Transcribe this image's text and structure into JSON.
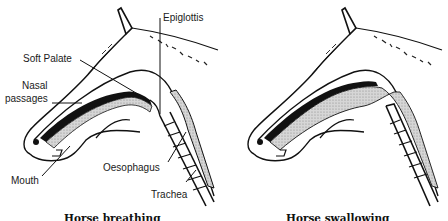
{
  "figure": {
    "panels": [
      {
        "id": "breathing",
        "caption": "Horse breathing",
        "labels": {
          "epiglottis": "Epiglottis",
          "soft_palate": "Soft Palate",
          "nasal_line1": "Nasal",
          "nasal_line2": "passages",
          "mouth": "Mouth",
          "oesophagus": "Oesophagus",
          "trachea": "Trachea"
        }
      },
      {
        "id": "swallowing",
        "caption": "Horse swallowing",
        "labels": {}
      }
    ],
    "colors": {
      "line": "#111111",
      "stipple": "#bdbdbd",
      "background": "#ffffff"
    }
  }
}
